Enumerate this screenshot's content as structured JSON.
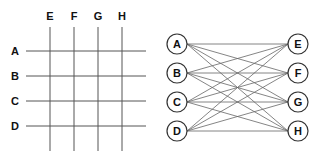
{
  "grid": {
    "columns": [
      {
        "label": "E",
        "x": 50
      },
      {
        "label": "F",
        "x": 74
      },
      {
        "label": "G",
        "x": 98
      },
      {
        "label": "H",
        "x": 122
      }
    ],
    "rows": [
      {
        "label": "A",
        "y": 51
      },
      {
        "label": "B",
        "y": 76
      },
      {
        "label": "C",
        "y": 101
      },
      {
        "label": "D",
        "y": 126
      }
    ],
    "line_color": "#555555"
  },
  "bipartite": {
    "left_nodes": [
      {
        "label": "A",
        "x": 177,
        "y": 44
      },
      {
        "label": "B",
        "x": 177,
        "y": 73
      },
      {
        "label": "C",
        "x": 177,
        "y": 102
      },
      {
        "label": "D",
        "x": 177,
        "y": 131
      }
    ],
    "right_nodes": [
      {
        "label": "E",
        "x": 298,
        "y": 44
      },
      {
        "label": "F",
        "x": 298,
        "y": 73
      },
      {
        "label": "G",
        "x": 298,
        "y": 102
      },
      {
        "label": "H",
        "x": 298,
        "y": 131
      }
    ],
    "node_radius": 10,
    "edges": "complete"
  }
}
